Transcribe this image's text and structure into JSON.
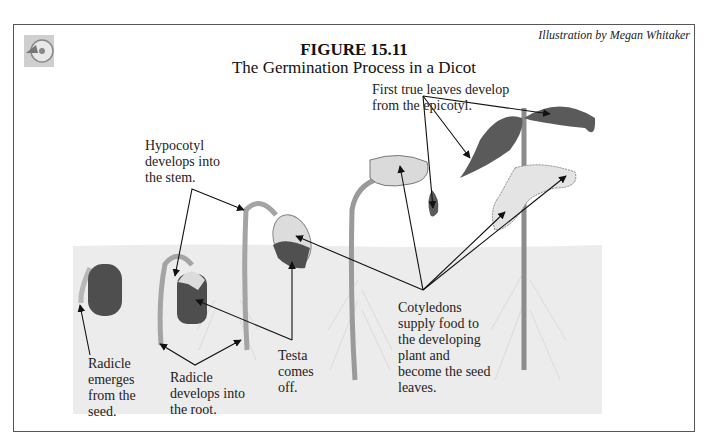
{
  "figure": {
    "number": "FIGURE 15.11",
    "title": "The Germination Process in a Dicot",
    "credit": "Illustration by Megan Whitaker"
  },
  "labels": {
    "radicle_emerges": [
      "Radicle",
      "emerges",
      "from the",
      "seed."
    ],
    "radicle_root": [
      "Radicle",
      "develops into",
      "the root."
    ],
    "hypocotyl": [
      "Hypocotyl",
      "develops into",
      "the stem."
    ],
    "testa": [
      "Testa",
      "comes",
      "off."
    ],
    "true_leaves": [
      "First true leaves develop",
      "from the epicotyl."
    ],
    "cotyledons": [
      "Cotyledons",
      "supply food to",
      "the developing",
      "plant and",
      "become the seed",
      "leaves."
    ]
  },
  "colors": {
    "soil": "#ececec",
    "seed": "#4e4e4e",
    "cotyledon": "#dcdcdc",
    "stem": "#9a9a9a",
    "leaf": "#5a5a5a",
    "arrow": "#111111"
  },
  "icons": {
    "corner": "cd-disc-icon"
  }
}
